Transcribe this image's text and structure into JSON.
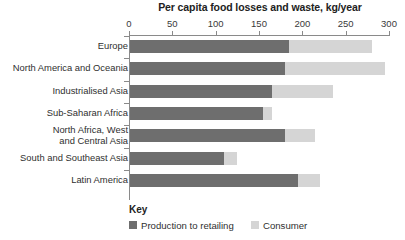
{
  "chart_data": {
    "type": "bar",
    "orientation": "horizontal",
    "stacked": true,
    "title": "Per capita food losses and waste, kg/year",
    "xlabel": "",
    "ylabel": "",
    "xlim": [
      0,
      300
    ],
    "xticks": [
      0,
      50,
      100,
      150,
      200,
      250,
      300
    ],
    "xtick_labels": [
      "0",
      "50",
      "100",
      "150",
      "200",
      "250",
      "300"
    ],
    "grid": false,
    "legend_position": "bottom-left",
    "legend_title": "Key",
    "categories": [
      "Europe",
      "North America and Oceania",
      "Industrialised Asia",
      "Sub-Saharan Africa",
      "North Africa, West and Central Asia",
      "South and Southeast Asia",
      "Latin America"
    ],
    "category_labels": [
      {
        "line1": "Europe",
        "line2": ""
      },
      {
        "line1": "North America and Oceania",
        "line2": ""
      },
      {
        "line1": "Industrialised Asia",
        "line2": ""
      },
      {
        "line1": "Sub-Saharan Africa",
        "line2": ""
      },
      {
        "line1": "North Africa, West",
        "line2": "and Central Asia"
      },
      {
        "line1": "South and Southeast Asia",
        "line2": ""
      },
      {
        "line1": "Latin America",
        "line2": ""
      }
    ],
    "series": [
      {
        "name": "Production to retailing",
        "color": "#6e6e6e",
        "values": [
          185,
          180,
          165,
          155,
          180,
          110,
          195
        ]
      },
      {
        "name": "Consumer",
        "color": "#d5d5d5",
        "values": [
          95,
          115,
          70,
          10,
          35,
          15,
          25
        ]
      }
    ],
    "totals": [
      280,
      295,
      235,
      165,
      215,
      125,
      220
    ]
  },
  "axis": {
    "line_color": "#8a8a8a"
  }
}
